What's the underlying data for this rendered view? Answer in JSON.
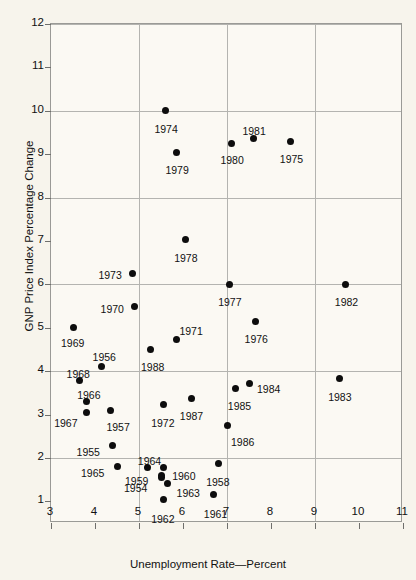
{
  "chart_data": {
    "type": "scatter",
    "title": "",
    "xlabel": "Unemployment Rate—Percent",
    "ylabel": "GNP Price Index Percentage Change",
    "xlim": [
      3,
      11
    ],
    "ylim": [
      0.5,
      12
    ],
    "xticks": [
      "3",
      "4",
      "5",
      "6",
      "7",
      "8",
      "9",
      "10",
      "11"
    ],
    "yticks": [
      "1",
      "2",
      "3",
      "4",
      "5",
      "6",
      "7",
      "8",
      "9",
      "10",
      "11",
      "12"
    ],
    "grid": {
      "vertical_at": [
        5,
        7,
        9
      ],
      "horizontal_at": [
        2,
        4,
        6,
        8,
        10,
        12
      ],
      "visible": true
    },
    "legend": null,
    "point_color": "#0d0d0d",
    "frame_color": "#9a9a96",
    "grid_color": "#b4b4b0",
    "background_color": "#f7f4ec",
    "points": [
      {
        "label": "1954",
        "x": 5.5,
        "y": 1.55,
        "lx": -37,
        "ly": 6
      },
      {
        "label": "1955",
        "x": 4.4,
        "y": 2.28,
        "lx": -36,
        "ly": 1
      },
      {
        "label": "1956",
        "x": 4.15,
        "y": 4.1,
        "lx": -9,
        "ly": -15
      },
      {
        "label": "1957",
        "x": 4.35,
        "y": 3.1,
        "lx": -4,
        "ly": 12
      },
      {
        "label": "1958",
        "x": 6.8,
        "y": 1.87,
        "lx": -12,
        "ly": 13
      },
      {
        "label": "1959",
        "x": 5.5,
        "y": 1.6,
        "lx": -36,
        "ly": 1
      },
      {
        "label": "1960",
        "x": 5.55,
        "y": 1.78,
        "lx": 9,
        "ly": 4
      },
      {
        "label": "1961",
        "x": 6.7,
        "y": 1.15,
        "lx": -10,
        "ly": 14
      },
      {
        "label": "1962",
        "x": 5.55,
        "y": 1.05,
        "lx": -12,
        "ly": 15
      },
      {
        "label": "1963",
        "x": 5.65,
        "y": 1.4,
        "lx": 9,
        "ly": 4
      },
      {
        "label": "1964",
        "x": 5.2,
        "y": 1.78,
        "lx": -10,
        "ly": -11
      },
      {
        "label": "1965",
        "x": 4.5,
        "y": 1.8,
        "lx": -36,
        "ly": 1
      },
      {
        "label": "1966",
        "x": 3.8,
        "y": 3.3,
        "lx": -9,
        "ly": -12
      },
      {
        "label": "1967",
        "x": 3.8,
        "y": 3.05,
        "lx": -32,
        "ly": 6
      },
      {
        "label": "1968",
        "x": 3.65,
        "y": 3.78,
        "lx": -13,
        "ly": -12
      },
      {
        "label": "1969",
        "x": 3.5,
        "y": 5.0,
        "lx": -12,
        "ly": 10
      },
      {
        "label": "1970",
        "x": 4.9,
        "y": 5.5,
        "lx": -34,
        "ly": -2
      },
      {
        "label": "1971",
        "x": 5.85,
        "y": 4.73,
        "lx": 3,
        "ly": -13
      },
      {
        "label": "1972",
        "x": 5.55,
        "y": 3.22,
        "lx": -12,
        "ly": 13
      },
      {
        "label": "1973",
        "x": 4.85,
        "y": 6.25,
        "lx": -34,
        "ly": -4
      },
      {
        "label": "1974",
        "x": 5.6,
        "y": 10.0,
        "lx": -11,
        "ly": 13
      },
      {
        "label": "1975",
        "x": 8.45,
        "y": 9.3,
        "lx": -11,
        "ly": 13
      },
      {
        "label": "1976",
        "x": 7.65,
        "y": 5.15,
        "lx": -11,
        "ly": 13
      },
      {
        "label": "1977",
        "x": 7.05,
        "y": 6.0,
        "lx": -11,
        "ly": 13
      },
      {
        "label": "1978",
        "x": 6.05,
        "y": 7.03,
        "lx": -11,
        "ly": 13
      },
      {
        "label": "1979",
        "x": 5.85,
        "y": 9.05,
        "lx": -11,
        "ly": 13
      },
      {
        "label": "1980",
        "x": 7.1,
        "y": 9.25,
        "lx": -11,
        "ly": 12
      },
      {
        "label": "1981",
        "x": 7.6,
        "y": 9.35,
        "lx": -11,
        "ly": -13
      },
      {
        "label": "1982",
        "x": 9.7,
        "y": 6.0,
        "lx": -11,
        "ly": 13
      },
      {
        "label": "1983",
        "x": 9.55,
        "y": 3.82,
        "lx": -11,
        "ly": 13
      },
      {
        "label": "1984",
        "x": 7.5,
        "y": 3.72,
        "lx": 8,
        "ly": 1
      },
      {
        "label": "1985",
        "x": 7.2,
        "y": 3.6,
        "lx": -8,
        "ly": 13
      },
      {
        "label": "1986",
        "x": 7.0,
        "y": 2.75,
        "lx": 4,
        "ly": 12
      },
      {
        "label": "1987",
        "x": 6.2,
        "y": 3.38,
        "lx": -12,
        "ly": 13
      },
      {
        "label": "1988",
        "x": 5.25,
        "y": 4.5,
        "lx": -9,
        "ly": 13
      }
    ]
  }
}
